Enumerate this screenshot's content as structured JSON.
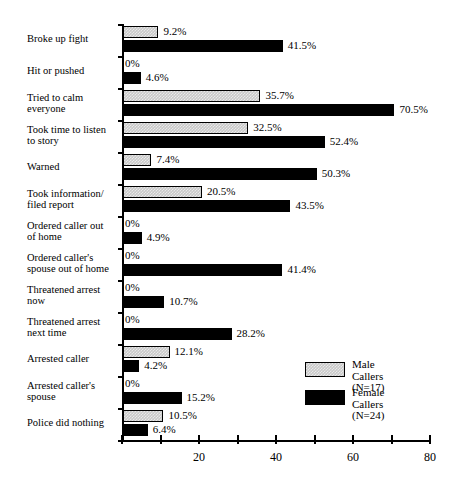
{
  "chart_data": {
    "type": "bar",
    "orientation": "horizontal",
    "title": "",
    "subtitle": "",
    "xlabel": "",
    "ylabel": "",
    "xlim": [
      0,
      80
    ],
    "xticks": [
      0,
      10,
      20,
      30,
      40,
      50,
      60,
      70,
      80
    ],
    "xtick_labels": [
      "",
      "",
      "20",
      "",
      "40",
      "",
      "60",
      "",
      "80"
    ],
    "grid": false,
    "legend_position": "inside-bottom-right",
    "categories": [
      "Broke up fight",
      "Hit or pushed",
      "Tried to calm\neveryone",
      "Took time to listen\nto story",
      "Warned",
      "Took information/\nfiled report",
      "Ordered caller out\nof home",
      "Ordered caller's\nspouse out of home",
      "Threatened arrest\nnow",
      "Threatened arrest\nnext time",
      "Arrested caller",
      "Arrested caller's\nspouse",
      "Police did nothing"
    ],
    "series": [
      {
        "name": "Male Callers",
        "n_label": "(N=17)",
        "color": "#c9c9c9",
        "values": [
          9.2,
          0,
          35.7,
          32.5,
          7.4,
          20.5,
          0,
          0,
          0,
          0,
          12.1,
          0,
          10.5
        ],
        "value_labels": [
          "9.2%",
          "0%",
          "35.7%",
          "32.5%",
          "7.4%",
          "20.5%",
          "0%",
          "0%",
          "0%",
          "0%",
          "12.1%",
          "0%",
          "10.5%"
        ]
      },
      {
        "name": "Female Callers",
        "n_label": "(N=24)",
        "color": "#000000",
        "values": [
          41.5,
          4.6,
          70.5,
          52.4,
          50.3,
          43.5,
          4.9,
          41.4,
          10.7,
          28.2,
          4.2,
          15.2,
          6.4
        ],
        "value_labels": [
          "41.5%",
          "4.6%",
          "70.5%",
          "52.4%",
          "50.3%",
          "43.5%",
          "4.9%",
          "41.4%",
          "10.7%",
          "28.2%",
          "4.2%",
          "15.2%",
          "6.4%"
        ]
      }
    ]
  },
  "legend": {
    "entries": [
      {
        "label": "Male Callers\n(N=17)",
        "swatch": "male"
      },
      {
        "label": "Female Callers\n(N=24)",
        "swatch": "female"
      }
    ]
  }
}
